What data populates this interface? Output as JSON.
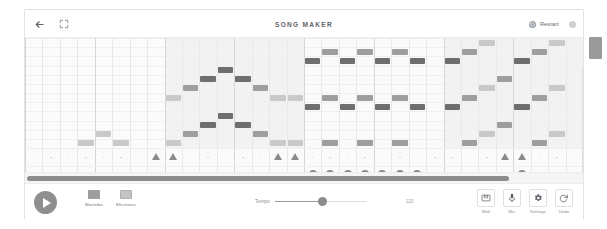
{
  "header": {
    "title": "SONG MAKER",
    "back_icon": "back-arrow-icon",
    "fullscreen_icon": "fullscreen-icon",
    "restart_label": "Restart",
    "restart_icon": "restart-icon",
    "menu_icon": "circle-icon"
  },
  "toolbar": {
    "play_label": "Play",
    "play_icon": "play-icon",
    "instruments": [
      {
        "label": "Marimba",
        "icon": "marimba-icon",
        "color": "#9e9e9e"
      },
      {
        "label": "Electronic",
        "icon": "electronic-icon",
        "color": "#bdbdbd"
      }
    ],
    "tempo_label": "Tempo",
    "tempo_value": "120",
    "tempo_percent": 52,
    "tools": [
      {
        "label": "Midi",
        "icon": "midi-keyboard-icon"
      },
      {
        "label": "Mic",
        "icon": "microphone-icon"
      },
      {
        "label": "Settings",
        "icon": "gear-icon"
      },
      {
        "label": "Undo",
        "icon": "undo-icon"
      }
    ]
  },
  "grid": {
    "columns": 32,
    "rows": 12,
    "beats_per_bar": 4,
    "progress_percent": 87,
    "colors": {
      "note_dark": "#6e6e6e",
      "note_mid": "#9e9e9e",
      "note_light": "#c9c9c9",
      "band": "#f1f1f1",
      "percussion_triangle": "#8a8a8a",
      "percussion_circle": "#8a8a8a"
    },
    "bands": [
      {
        "start_col": 8,
        "end_col": 16,
        "color": "#f2f2f2"
      },
      {
        "start_col": 16,
        "end_col": 24,
        "color": "#fafafa"
      },
      {
        "start_col": 24,
        "end_col": 32,
        "color": "#f2f2f2"
      }
    ],
    "notes": [
      {
        "col": 0,
        "row": 11,
        "shade": "note_dark"
      },
      {
        "col": 1,
        "row": 10,
        "shade": "note_mid"
      },
      {
        "col": 2,
        "row": 10,
        "shade": "note_mid"
      },
      {
        "col": 3,
        "row": 9,
        "shade": "note_light"
      },
      {
        "col": 4,
        "row": 8,
        "shade": "note_light"
      },
      {
        "col": 5,
        "row": 9,
        "shade": "note_light"
      },
      {
        "col": 6,
        "row": 10,
        "shade": "note_mid"
      },
      {
        "col": 7,
        "row": 11,
        "shade": "note_dark"
      },
      {
        "col": 8,
        "row": 9,
        "shade": "note_light"
      },
      {
        "col": 9,
        "row": 8,
        "shade": "note_mid"
      },
      {
        "col": 10,
        "row": 7,
        "shade": "note_dark"
      },
      {
        "col": 11,
        "row": 6,
        "shade": "note_dark"
      },
      {
        "col": 12,
        "row": 7,
        "shade": "note_dark"
      },
      {
        "col": 13,
        "row": 8,
        "shade": "note_mid"
      },
      {
        "col": 14,
        "row": 9,
        "shade": "note_light"
      },
      {
        "col": 15,
        "row": 9,
        "shade": "note_light"
      },
      {
        "col": 8,
        "row": 4,
        "shade": "note_light"
      },
      {
        "col": 9,
        "row": 3,
        "shade": "note_mid"
      },
      {
        "col": 10,
        "row": 2,
        "shade": "note_dark"
      },
      {
        "col": 11,
        "row": 1,
        "shade": "note_dark"
      },
      {
        "col": 12,
        "row": 2,
        "shade": "note_dark"
      },
      {
        "col": 13,
        "row": 3,
        "shade": "note_mid"
      },
      {
        "col": 14,
        "row": 4,
        "shade": "note_light"
      },
      {
        "col": 15,
        "row": 4,
        "shade": "note_light"
      },
      {
        "col": 16,
        "row": 0,
        "shade": "note_dark"
      },
      {
        "col": 17,
        "row": -1,
        "shade": "note_mid"
      },
      {
        "col": 18,
        "row": 0,
        "shade": "note_dark"
      },
      {
        "col": 19,
        "row": -1,
        "shade": "note_mid"
      },
      {
        "col": 20,
        "row": 0,
        "shade": "note_dark"
      },
      {
        "col": 21,
        "row": -1,
        "shade": "note_mid"
      },
      {
        "col": 22,
        "row": 0,
        "shade": "note_dark"
      },
      {
        "col": 16,
        "row": 5,
        "shade": "note_dark"
      },
      {
        "col": 17,
        "row": 4,
        "shade": "note_mid"
      },
      {
        "col": 18,
        "row": 5,
        "shade": "note_dark"
      },
      {
        "col": 19,
        "row": 4,
        "shade": "note_mid"
      },
      {
        "col": 20,
        "row": 5,
        "shade": "note_dark"
      },
      {
        "col": 21,
        "row": 4,
        "shade": "note_mid"
      },
      {
        "col": 22,
        "row": 5,
        "shade": "note_dark"
      },
      {
        "col": 16,
        "row": 10,
        "shade": "note_dark"
      },
      {
        "col": 17,
        "row": 9,
        "shade": "note_mid"
      },
      {
        "col": 18,
        "row": 10,
        "shade": "note_dark"
      },
      {
        "col": 19,
        "row": 9,
        "shade": "note_mid"
      },
      {
        "col": 20,
        "row": 10,
        "shade": "note_dark"
      },
      {
        "col": 21,
        "row": 9,
        "shade": "note_mid"
      },
      {
        "col": 22,
        "row": 10,
        "shade": "note_dark"
      },
      {
        "col": 24,
        "row": 0,
        "shade": "note_dark"
      },
      {
        "col": 25,
        "row": -1,
        "shade": "note_mid"
      },
      {
        "col": 26,
        "row": -2,
        "shade": "note_light"
      },
      {
        "col": 28,
        "row": 0,
        "shade": "note_dark"
      },
      {
        "col": 29,
        "row": -1,
        "shade": "note_mid"
      },
      {
        "col": 30,
        "row": -2,
        "shade": "note_light"
      },
      {
        "col": 24,
        "row": 5,
        "shade": "note_dark"
      },
      {
        "col": 25,
        "row": 4,
        "shade": "note_mid"
      },
      {
        "col": 26,
        "row": 3,
        "shade": "note_light"
      },
      {
        "col": 27,
        "row": 2,
        "shade": "note_mid"
      },
      {
        "col": 28,
        "row": 5,
        "shade": "note_dark"
      },
      {
        "col": 29,
        "row": 4,
        "shade": "note_mid"
      },
      {
        "col": 30,
        "row": 3,
        "shade": "note_light"
      },
      {
        "col": 24,
        "row": 10,
        "shade": "note_dark"
      },
      {
        "col": 25,
        "row": 9,
        "shade": "note_mid"
      },
      {
        "col": 26,
        "row": 8,
        "shade": "note_light"
      },
      {
        "col": 27,
        "row": 7,
        "shade": "note_mid"
      },
      {
        "col": 28,
        "row": 10,
        "shade": "note_dark"
      },
      {
        "col": 29,
        "row": 9,
        "shade": "note_mid"
      },
      {
        "col": 30,
        "row": 8,
        "shade": "note_light"
      }
    ],
    "percussion_triangles": [
      7,
      8,
      14,
      15,
      27,
      28
    ],
    "percussion_circles": [
      16,
      17,
      18,
      19,
      20,
      21,
      22,
      28
    ]
  }
}
